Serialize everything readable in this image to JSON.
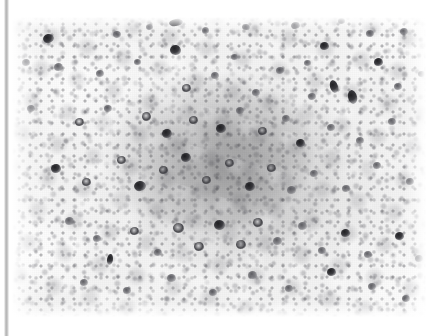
{
  "image": {
    "kind": "photomicrograph",
    "modality": "immunohistochemistry",
    "stain_appearance": "grayscale, dark-brown chromogen rendered as black, pale counterstain",
    "magnification_visible": "none",
    "scale_bar_visible": "none",
    "caption_text": "",
    "label_text": "",
    "background_color": "#ffffff",
    "tissue_base_color": "#f0f0f0",
    "positive_cell_color": "#262629",
    "mid_cell_color": "#6e6e74"
  },
  "plate": {
    "left": 12,
    "top": 17,
    "width": 414,
    "height": 300
  },
  "edge_bar": {
    "name": "scan-edge-bar",
    "left": 4,
    "width": 5,
    "color": "#b4b4b4"
  },
  "regions": [
    {
      "name": "germinal-center",
      "note": "dense darker cellular nodule, centre of field"
    },
    {
      "name": "mantle-zone",
      "note": "paler rim of small cells surrounding the nodule"
    },
    {
      "name": "interfollicular-area",
      "note": "sparse pale cells, left and lower-right corners"
    }
  ],
  "positive_cells": [
    {
      "x": 48,
      "y": 38,
      "w": 11,
      "h": 9,
      "r": -14,
      "tone": "dark"
    },
    {
      "x": 117,
      "y": 34,
      "w": 8,
      "h": 7,
      "r": 10,
      "tone": "mid"
    },
    {
      "x": 149,
      "y": 27,
      "w": 7,
      "h": 6,
      "r": 0,
      "tone": "mid"
    },
    {
      "x": 176,
      "y": 22,
      "w": 14,
      "h": 7,
      "r": -8,
      "tone": "dark"
    },
    {
      "x": 205,
      "y": 30,
      "w": 7,
      "h": 7,
      "r": 0,
      "tone": "mid"
    },
    {
      "x": 246,
      "y": 27,
      "w": 8,
      "h": 6,
      "r": 12,
      "tone": "mid"
    },
    {
      "x": 295,
      "y": 25,
      "w": 9,
      "h": 7,
      "r": -6,
      "tone": "mid"
    },
    {
      "x": 324,
      "y": 46,
      "w": 9,
      "h": 8,
      "r": 0,
      "tone": "dark"
    },
    {
      "x": 341,
      "y": 21,
      "w": 7,
      "h": 6,
      "r": 0,
      "tone": "mid"
    },
    {
      "x": 370,
      "y": 33,
      "w": 8,
      "h": 7,
      "r": 0,
      "tone": "mid"
    },
    {
      "x": 404,
      "y": 31,
      "w": 8,
      "h": 7,
      "r": 0,
      "tone": "mid"
    },
    {
      "x": 26,
      "y": 62,
      "w": 8,
      "h": 7,
      "r": 0,
      "tone": "mid"
    },
    {
      "x": 58,
      "y": 67,
      "w": 9,
      "h": 8,
      "r": 0,
      "tone": "mid"
    },
    {
      "x": 100,
      "y": 73,
      "w": 8,
      "h": 7,
      "r": 0,
      "tone": "mid"
    },
    {
      "x": 137,
      "y": 62,
      "w": 7,
      "h": 6,
      "r": 0,
      "tone": "mid"
    },
    {
      "x": 175,
      "y": 50,
      "w": 11,
      "h": 10,
      "r": 8,
      "tone": "dark"
    },
    {
      "x": 186,
      "y": 88,
      "w": 9,
      "h": 8,
      "r": 0,
      "tone": "ring"
    },
    {
      "x": 215,
      "y": 75,
      "w": 8,
      "h": 7,
      "r": 0,
      "tone": "mid"
    },
    {
      "x": 234,
      "y": 57,
      "w": 7,
      "h": 6,
      "r": 0,
      "tone": "mid"
    },
    {
      "x": 256,
      "y": 92,
      "w": 8,
      "h": 7,
      "r": 0,
      "tone": "mid"
    },
    {
      "x": 280,
      "y": 70,
      "w": 8,
      "h": 7,
      "r": 0,
      "tone": "mid"
    },
    {
      "x": 307,
      "y": 63,
      "w": 7,
      "h": 6,
      "r": 0,
      "tone": "mid"
    },
    {
      "x": 312,
      "y": 96,
      "w": 8,
      "h": 7,
      "r": 0,
      "tone": "mid"
    },
    {
      "x": 334,
      "y": 86,
      "w": 8,
      "h": 13,
      "r": -18,
      "tone": "dark"
    },
    {
      "x": 352,
      "y": 97,
      "w": 9,
      "h": 14,
      "r": -14,
      "tone": "dark"
    },
    {
      "x": 378,
      "y": 62,
      "w": 9,
      "h": 8,
      "r": 0,
      "tone": "dark"
    },
    {
      "x": 398,
      "y": 86,
      "w": 8,
      "h": 7,
      "r": 0,
      "tone": "mid"
    },
    {
      "x": 421,
      "y": 74,
      "w": 7,
      "h": 6,
      "r": 0,
      "tone": "mid"
    },
    {
      "x": 31,
      "y": 108,
      "w": 8,
      "h": 7,
      "r": 0,
      "tone": "mid"
    },
    {
      "x": 79,
      "y": 122,
      "w": 9,
      "h": 8,
      "r": 0,
      "tone": "ring"
    },
    {
      "x": 108,
      "y": 108,
      "w": 8,
      "h": 7,
      "r": 0,
      "tone": "mid"
    },
    {
      "x": 146,
      "y": 116,
      "w": 9,
      "h": 9,
      "r": 0,
      "tone": "ring"
    },
    {
      "x": 167,
      "y": 133,
      "w": 10,
      "h": 9,
      "r": 0,
      "tone": "dark"
    },
    {
      "x": 193,
      "y": 120,
      "w": 9,
      "h": 8,
      "r": 0,
      "tone": "ring"
    },
    {
      "x": 221,
      "y": 128,
      "w": 10,
      "h": 9,
      "r": 0,
      "tone": "dark"
    },
    {
      "x": 240,
      "y": 110,
      "w": 8,
      "h": 7,
      "r": 0,
      "tone": "mid"
    },
    {
      "x": 262,
      "y": 131,
      "w": 9,
      "h": 8,
      "r": 0,
      "tone": "ring"
    },
    {
      "x": 286,
      "y": 118,
      "w": 8,
      "h": 7,
      "r": 0,
      "tone": "mid"
    },
    {
      "x": 300,
      "y": 143,
      "w": 9,
      "h": 8,
      "r": 0,
      "tone": "dark"
    },
    {
      "x": 331,
      "y": 127,
      "w": 8,
      "h": 7,
      "r": 0,
      "tone": "mid"
    },
    {
      "x": 360,
      "y": 140,
      "w": 8,
      "h": 7,
      "r": 0,
      "tone": "mid"
    },
    {
      "x": 392,
      "y": 121,
      "w": 8,
      "h": 7,
      "r": 0,
      "tone": "mid"
    },
    {
      "x": 56,
      "y": 168,
      "w": 10,
      "h": 9,
      "r": 0,
      "tone": "dark"
    },
    {
      "x": 86,
      "y": 182,
      "w": 9,
      "h": 8,
      "r": 0,
      "tone": "ring"
    },
    {
      "x": 121,
      "y": 160,
      "w": 9,
      "h": 8,
      "r": 0,
      "tone": "ring"
    },
    {
      "x": 140,
      "y": 186,
      "w": 12,
      "h": 10,
      "r": -10,
      "tone": "dark"
    },
    {
      "x": 163,
      "y": 170,
      "w": 9,
      "h": 8,
      "r": 0,
      "tone": "ring"
    },
    {
      "x": 186,
      "y": 157,
      "w": 10,
      "h": 9,
      "r": 0,
      "tone": "dark"
    },
    {
      "x": 206,
      "y": 180,
      "w": 9,
      "h": 8,
      "r": 0,
      "tone": "ring"
    },
    {
      "x": 229,
      "y": 163,
      "w": 9,
      "h": 8,
      "r": 0,
      "tone": "ring"
    },
    {
      "x": 250,
      "y": 186,
      "w": 10,
      "h": 9,
      "r": 0,
      "tone": "dark"
    },
    {
      "x": 271,
      "y": 168,
      "w": 9,
      "h": 8,
      "r": 0,
      "tone": "ring"
    },
    {
      "x": 291,
      "y": 190,
      "w": 9,
      "h": 8,
      "r": 0,
      "tone": "mid"
    },
    {
      "x": 314,
      "y": 173,
      "w": 8,
      "h": 7,
      "r": 0,
      "tone": "mid"
    },
    {
      "x": 346,
      "y": 188,
      "w": 8,
      "h": 7,
      "r": 0,
      "tone": "mid"
    },
    {
      "x": 377,
      "y": 165,
      "w": 8,
      "h": 7,
      "r": 0,
      "tone": "mid"
    },
    {
      "x": 410,
      "y": 181,
      "w": 8,
      "h": 7,
      "r": 0,
      "tone": "mid"
    },
    {
      "x": 69,
      "y": 221,
      "w": 9,
      "h": 8,
      "r": 0,
      "tone": "mid"
    },
    {
      "x": 97,
      "y": 238,
      "w": 8,
      "h": 7,
      "r": 0,
      "tone": "mid"
    },
    {
      "x": 110,
      "y": 259,
      "w": 6,
      "h": 11,
      "r": 8,
      "tone": "dark"
    },
    {
      "x": 134,
      "y": 231,
      "w": 9,
      "h": 8,
      "r": 0,
      "tone": "ring"
    },
    {
      "x": 158,
      "y": 252,
      "w": 8,
      "h": 7,
      "r": 0,
      "tone": "mid"
    },
    {
      "x": 178,
      "y": 228,
      "w": 11,
      "h": 10,
      "r": 0,
      "tone": "ring"
    },
    {
      "x": 199,
      "y": 246,
      "w": 10,
      "h": 9,
      "r": 0,
      "tone": "ring"
    },
    {
      "x": 219,
      "y": 225,
      "w": 11,
      "h": 10,
      "r": 0,
      "tone": "dark"
    },
    {
      "x": 241,
      "y": 244,
      "w": 10,
      "h": 9,
      "r": 0,
      "tone": "ring"
    },
    {
      "x": 258,
      "y": 222,
      "w": 10,
      "h": 9,
      "r": 0,
      "tone": "ring"
    },
    {
      "x": 277,
      "y": 241,
      "w": 9,
      "h": 8,
      "r": 0,
      "tone": "mid"
    },
    {
      "x": 302,
      "y": 226,
      "w": 9,
      "h": 8,
      "r": 0,
      "tone": "mid"
    },
    {
      "x": 322,
      "y": 250,
      "w": 8,
      "h": 7,
      "r": 0,
      "tone": "mid"
    },
    {
      "x": 345,
      "y": 233,
      "w": 9,
      "h": 8,
      "r": 0,
      "tone": "dark"
    },
    {
      "x": 368,
      "y": 254,
      "w": 8,
      "h": 7,
      "r": 0,
      "tone": "mid"
    },
    {
      "x": 399,
      "y": 236,
      "w": 9,
      "h": 8,
      "r": 0,
      "tone": "dark"
    },
    {
      "x": 419,
      "y": 258,
      "w": 8,
      "h": 7,
      "r": 0,
      "tone": "mid"
    },
    {
      "x": 84,
      "y": 282,
      "w": 8,
      "h": 7,
      "r": 0,
      "tone": "mid"
    },
    {
      "x": 127,
      "y": 290,
      "w": 8,
      "h": 7,
      "r": 0,
      "tone": "mid"
    },
    {
      "x": 171,
      "y": 278,
      "w": 9,
      "h": 8,
      "r": 0,
      "tone": "mid"
    },
    {
      "x": 213,
      "y": 292,
      "w": 8,
      "h": 7,
      "r": 0,
      "tone": "mid"
    },
    {
      "x": 252,
      "y": 275,
      "w": 9,
      "h": 8,
      "r": 0,
      "tone": "mid"
    },
    {
      "x": 289,
      "y": 288,
      "w": 8,
      "h": 7,
      "r": 0,
      "tone": "mid"
    },
    {
      "x": 331,
      "y": 272,
      "w": 9,
      "h": 8,
      "r": 0,
      "tone": "dark"
    },
    {
      "x": 372,
      "y": 286,
      "w": 8,
      "h": 7,
      "r": 0,
      "tone": "mid"
    },
    {
      "x": 406,
      "y": 298,
      "w": 8,
      "h": 7,
      "r": 0,
      "tone": "mid"
    }
  ]
}
